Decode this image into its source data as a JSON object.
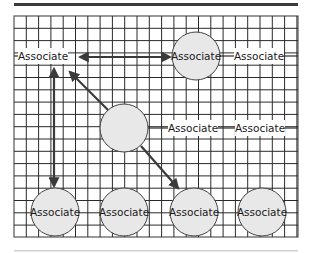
{
  "diagram": {
    "type": "network-on-grid",
    "colors": {
      "top_rule": "#3a3a3a",
      "bottom_rule": "#cfcfcf",
      "grid_line": "#2a2a2a",
      "grid_border": "#555555",
      "node_fill": "#e8e8e8",
      "node_stroke": "#444444",
      "arrow": "#3a3a3a",
      "label_bg": "#ffffff"
    },
    "grid": {
      "x": 14,
      "y": 16,
      "width": 284,
      "height": 221,
      "cell": 12.3
    },
    "nodes": [
      {
        "id": "n1",
        "kind": "label",
        "text": "Associate",
        "cx": 43,
        "cy": 56
      },
      {
        "id": "n2",
        "kind": "circle",
        "text": "Associate",
        "cx": 196,
        "cy": 56,
        "r": 24
      },
      {
        "id": "n3",
        "kind": "label",
        "text": "Associate",
        "cx": 259,
        "cy": 56
      },
      {
        "id": "n4",
        "kind": "circle",
        "text": "",
        "cx": 124,
        "cy": 128,
        "r": 24
      },
      {
        "id": "n5",
        "kind": "label",
        "text": "Associate",
        "cx": 193,
        "cy": 128
      },
      {
        "id": "n6",
        "kind": "label",
        "text": "Associate",
        "cx": 260,
        "cy": 128
      },
      {
        "id": "n7",
        "kind": "circle",
        "text": "Associate",
        "cx": 55,
        "cy": 212,
        "r": 24
      },
      {
        "id": "n8",
        "kind": "circle",
        "text": "Associate",
        "cx": 124,
        "cy": 212,
        "r": 24
      },
      {
        "id": "n9",
        "kind": "circle",
        "text": "Associate",
        "cx": 194,
        "cy": 212,
        "r": 24
      },
      {
        "id": "n10",
        "kind": "circle",
        "text": "Associate",
        "cx": 262,
        "cy": 212,
        "r": 24
      }
    ],
    "edges": [
      {
        "from": "n1",
        "to": "n2",
        "direction": "both",
        "x1": 80,
        "y1": 57,
        "x2": 170,
        "y2": 57
      },
      {
        "from": "n1",
        "to": "n7",
        "direction": "both",
        "x1": 54,
        "y1": 69,
        "x2": 54,
        "y2": 186
      },
      {
        "from": "n4",
        "to": "n1",
        "direction": "to",
        "x1": 108,
        "y1": 110,
        "x2": 70,
        "y2": 72
      },
      {
        "from": "n4",
        "to": "n9",
        "direction": "to",
        "x1": 141,
        "y1": 146,
        "x2": 178,
        "y2": 188
      }
    ],
    "connector_ticks": [
      {
        "from": "n2",
        "to": "n3",
        "x1": 220,
        "y1": 56,
        "x2": 234,
        "y2": 56
      },
      {
        "from": "n3",
        "to": "grid-edge",
        "x1": 284,
        "y1": 56,
        "x2": 298,
        "y2": 56
      },
      {
        "from": "n1",
        "to": "grid-edge",
        "x1": 14,
        "y1": 56,
        "x2": 20,
        "y2": 56
      },
      {
        "from": "n4",
        "to": "n5",
        "x1": 148,
        "y1": 128,
        "x2": 168,
        "y2": 128
      },
      {
        "from": "n5",
        "to": "n6",
        "x1": 218,
        "y1": 128,
        "x2": 236,
        "y2": 128
      },
      {
        "from": "n6",
        "to": "grid-edge",
        "x1": 285,
        "y1": 128,
        "x2": 298,
        "y2": 128
      }
    ]
  }
}
